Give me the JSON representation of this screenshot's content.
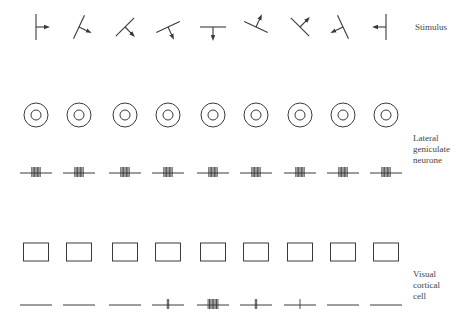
{
  "figure": {
    "type": "neuroscience-diagram",
    "columns": 9,
    "column_x": [
      36,
      79,
      125,
      168,
      213,
      256,
      300,
      343,
      386
    ],
    "stroke_color": "#3a3a3a"
  },
  "rows": {
    "stimulus": {
      "label_lines": [
        "Stimulus"
      ],
      "y": 27,
      "orientations_deg": [
        90,
        65,
        45,
        25,
        0,
        155,
        135,
        115,
        90
      ],
      "arrow_direction": [
        "right",
        "down-right",
        "down-right",
        "down-right",
        "down",
        "down-left",
        "down-left",
        "left-down",
        "left"
      ]
    },
    "lgn_receptive_field": {
      "y": 115,
      "shape": "concentric-circles"
    },
    "lgn_response": {
      "label_lines": [
        "Lateral",
        "geniculate",
        "neurone"
      ],
      "y": 173,
      "spike_counts": [
        7,
        7,
        7,
        7,
        7,
        7,
        7,
        7,
        7
      ]
    },
    "cortical_receptive_field": {
      "y": 252,
      "shape": "rectangle"
    },
    "cortical_response": {
      "label_lines": [
        "Visual",
        "cortical",
        "cell"
      ],
      "y": 305,
      "spike_counts": [
        0,
        0,
        0,
        2,
        8,
        2,
        1,
        0,
        0
      ]
    }
  },
  "caption": "Fig. ... Response of lateral geniculate neurone and visual cortical cell to oriented stimuli"
}
